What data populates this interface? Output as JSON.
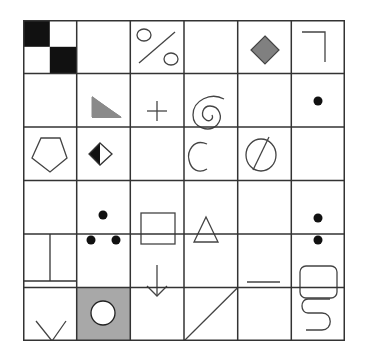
{
  "grid": {
    "rows": 6,
    "cols": 6,
    "line_color": "#333333",
    "cells": [
      [
        "checker-2x2",
        "empty",
        "percent",
        "empty",
        "diamond-gray",
        "corner-top-right"
      ],
      [
        "empty",
        "right-triangle-gray",
        "plus",
        "spiral",
        "empty",
        "dot"
      ],
      [
        "pentagon",
        "half-filled-diamond",
        "empty",
        "letter-c",
        "empty-set",
        "empty"
      ],
      [
        "empty",
        "three-dots",
        "square",
        "triangle",
        "empty",
        "two-dots-vertical"
      ],
      [
        "split-rectangle",
        "empty",
        "down-arrow",
        "empty",
        "dash",
        "rounded-square"
      ],
      [
        "v-shape",
        "circle-on-gray",
        "empty",
        "diagonal-line",
        "empty",
        "s-shape"
      ]
    ]
  },
  "colors": {
    "black": "#111111",
    "gray_fill": "#8a8a8a",
    "cell_gray_bg": "#a8a8a8",
    "stroke": "#444444"
  }
}
